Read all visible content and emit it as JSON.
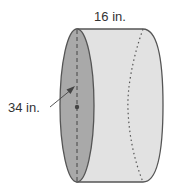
{
  "figure": {
    "type": "cylinder",
    "labels": {
      "length": "16 in.",
      "diameter": "34 in."
    },
    "colors": {
      "face": "#a9a9a9",
      "side": "#e2e2e2",
      "outline": "#555555",
      "text": "#333333"
    }
  }
}
